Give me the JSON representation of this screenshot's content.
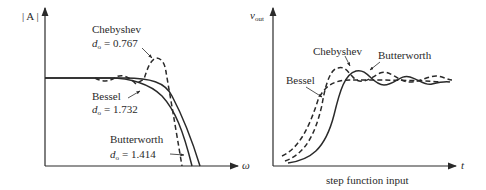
{
  "left_panel": {
    "y_axis_label": "| A |",
    "x_axis_label": "ω",
    "curves": [
      {
        "name": "Chebyshev",
        "style": "dashed",
        "param": "d₀ = 0.767",
        "param_prefix": "d",
        "param_sub": "o",
        "param_value": "= 0.767"
      },
      {
        "name": "Bessel",
        "style": "solid",
        "param": "d₀ = 1.732",
        "param_prefix": "d",
        "param_sub": "o",
        "param_value": "= 1.732"
      },
      {
        "name": "Butterworth",
        "style": "solid",
        "param": "d₀ = 1.414",
        "param_prefix": "d",
        "param_sub": "o",
        "param_value": "= 1.414"
      }
    ]
  },
  "right_panel": {
    "y_axis_label": "v",
    "y_axis_sub": "out",
    "x_axis_label": "t",
    "caption": "step function input",
    "curves": [
      {
        "name": "Chebyshev",
        "style": "dashed"
      },
      {
        "name": "Butterworth",
        "style": "solid"
      },
      {
        "name": "Bessel",
        "style": "dashed"
      }
    ]
  }
}
